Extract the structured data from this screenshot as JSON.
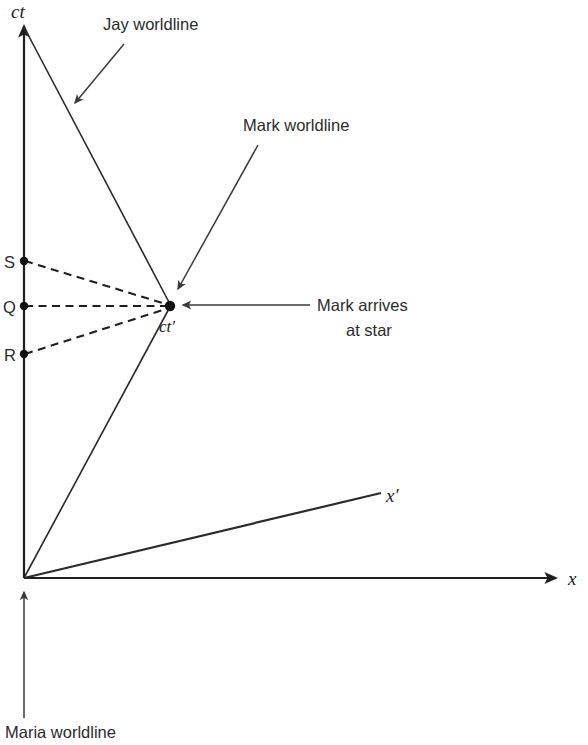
{
  "figure": {
    "type": "spacetime-diagram",
    "title": "",
    "background_color": "#ffffff",
    "line_color": "#2a2a2a",
    "text_color": "#2b2b2b"
  },
  "axes": {
    "vertical": {
      "name": "ct-axis",
      "label": "ct",
      "description": "time axis (Maria frame)",
      "origin": [
        24,
        578
      ],
      "tip": [
        24,
        22
      ],
      "arrowhead": true
    },
    "horizontal": {
      "name": "x-axis",
      "label": "x",
      "description": "space axis (Maria frame)",
      "origin": [
        24,
        578
      ],
      "tip": [
        561,
        578
      ],
      "arrowhead": true
    },
    "primed_space": {
      "name": "x-prime-axis",
      "label": "x′",
      "description": "space axis of Mark's frame",
      "origin": [
        24,
        578
      ],
      "tip": [
        381,
        493
      ],
      "arrowhead": false
    },
    "primed_time": {
      "name": "ct-prime-axis",
      "label": "ct′",
      "description": "time axis of Mark's frame / Mark worldline",
      "origin": [
        24,
        578
      ],
      "tip": [
        170,
        306
      ],
      "arrowhead": false
    }
  },
  "worldlines": [
    {
      "name": "maria-worldline",
      "label": "Maria worldline",
      "from": [
        24,
        578
      ],
      "to": [
        24,
        22
      ],
      "style": "solid"
    },
    {
      "name": "jay-worldline",
      "label": "Jay worldline",
      "from": [
        24,
        27
      ],
      "to": [
        170,
        306
      ],
      "style": "solid"
    },
    {
      "name": "mark-worldline",
      "label": "Mark worldline",
      "from": [
        24,
        578
      ],
      "to": [
        170,
        306
      ],
      "style": "solid"
    }
  ],
  "events": [
    {
      "name": "event-s",
      "label": "S",
      "dot": [
        24,
        261
      ],
      "label_pos": [
        5,
        267
      ]
    },
    {
      "name": "event-q",
      "label": "Q",
      "dot": [
        24,
        306
      ],
      "label_pos": [
        4,
        312
      ]
    },
    {
      "name": "event-r",
      "label": "R",
      "dot": [
        24,
        354
      ],
      "label_pos": [
        5,
        360
      ]
    },
    {
      "name": "event-arrival",
      "label": "ct′",
      "dot": [
        170,
        306
      ],
      "label_pos": [
        159,
        332
      ]
    }
  ],
  "signal_lines": [
    {
      "name": "signal-s-to-arrival",
      "from": [
        24,
        261
      ],
      "to": [
        170,
        306
      ],
      "style": "dashed"
    },
    {
      "name": "signal-q-to-arrival",
      "from": [
        24,
        306
      ],
      "to": [
        170,
        306
      ],
      "style": "dashed"
    },
    {
      "name": "signal-r-to-arrival",
      "from": [
        24,
        354
      ],
      "to": [
        170,
        306
      ],
      "style": "dashed"
    }
  ],
  "annotations": [
    {
      "name": "annotation-jay-worldline",
      "text": "Jay worldline",
      "text_pos": [
        103,
        30
      ],
      "leader_from": [
        124,
        44
      ],
      "leader_to": [
        73,
        105
      ],
      "arrowhead": true,
      "anchor": "start"
    },
    {
      "name": "annotation-mark-worldline",
      "text": "Mark worldline",
      "text_pos": [
        243,
        131
      ],
      "leader_from": [
        258,
        145
      ],
      "leader_to": [
        176,
        292
      ],
      "arrowhead": true,
      "anchor": "start"
    },
    {
      "name": "annotation-mark-arrives",
      "text_line_1": "Mark arrives",
      "text_line_2": "at star",
      "text_pos_1": [
        317,
        311
      ],
      "text_pos_2": [
        346,
        336
      ],
      "leader_from": [
        310,
        305
      ],
      "leader_to": [
        181,
        305
      ],
      "arrowhead": true,
      "anchor": "start"
    },
    {
      "name": "annotation-maria-worldline",
      "text": "Maria worldline",
      "text_pos": [
        5,
        738
      ],
      "leader_from": [
        24,
        718
      ],
      "leader_to": [
        24,
        589
      ],
      "arrowhead": true,
      "anchor": "start"
    }
  ]
}
